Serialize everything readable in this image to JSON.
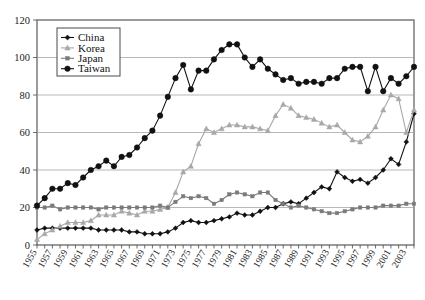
{
  "chart_data": {
    "type": "line",
    "title": "",
    "subtitle": "",
    "xlabel": "",
    "ylabel": "",
    "xlim": [
      1955,
      2004
    ],
    "ylim": [
      0,
      120
    ],
    "grid": true,
    "legend_position": "top-left-inside",
    "y_ticks": [
      0,
      20,
      40,
      60,
      80,
      100,
      120
    ],
    "y_tick_labels": [
      "0",
      "20",
      "40",
      "60",
      "80",
      "100",
      "120"
    ],
    "x_tick_labels": [
      "1955",
      "1957",
      "1959",
      "1961",
      "1963",
      "1965",
      "1967",
      "1969",
      "1971",
      "1973",
      "1975",
      "1977",
      "1979",
      "1981",
      "1983",
      "1985",
      "1987",
      "1989",
      "1991",
      "1993",
      "1995",
      "1997",
      "1999",
      "2001",
      "2003"
    ],
    "x": [
      1955,
      1956,
      1957,
      1958,
      1959,
      1960,
      1961,
      1962,
      1963,
      1964,
      1965,
      1966,
      1967,
      1968,
      1969,
      1970,
      1971,
      1972,
      1973,
      1974,
      1975,
      1976,
      1977,
      1978,
      1979,
      1980,
      1981,
      1982,
      1983,
      1984,
      1985,
      1986,
      1987,
      1988,
      1989,
      1990,
      1991,
      1992,
      1993,
      1994,
      1995,
      1996,
      1997,
      1998,
      1999,
      2000,
      2001,
      2002,
      2003,
      2004
    ],
    "series": [
      {
        "name": "China",
        "marker": "diamond",
        "color": "#111111",
        "values": [
          8,
          9,
          9,
          9,
          9,
          9,
          9,
          9,
          8,
          8,
          8,
          8,
          7,
          7,
          6,
          6,
          6,
          7,
          9,
          12,
          13,
          12,
          12,
          13,
          14,
          15,
          17,
          16,
          16,
          18,
          20,
          20,
          22,
          23,
          22,
          25,
          28,
          31,
          30,
          39,
          36,
          34,
          35,
          33,
          36,
          40,
          46,
          43,
          55,
          70
        ]
      },
      {
        "name": "Korea",
        "marker": "triangle",
        "color": "#a8a8a8",
        "values": [
          3,
          6,
          8,
          10,
          12,
          12,
          12,
          13,
          16,
          16,
          16,
          18,
          17,
          16,
          18,
          18,
          19,
          20,
          28,
          39,
          42,
          54,
          62,
          60,
          62,
          64,
          64,
          63,
          63,
          62,
          61,
          69,
          75,
          73,
          69,
          68,
          67,
          65,
          63,
          64,
          60,
          56,
          55,
          58,
          63,
          72,
          80,
          78,
          60,
          72
        ]
      },
      {
        "name": "Japan",
        "marker": "square",
        "color": "#7a7a7a",
        "values": [
          20,
          20,
          21,
          19,
          20,
          20,
          20,
          20,
          19,
          20,
          20,
          20,
          20,
          20,
          20,
          20,
          21,
          20,
          23,
          26,
          25,
          26,
          25,
          22,
          24,
          27,
          28,
          27,
          26,
          28,
          28,
          24,
          22,
          20,
          21,
          20,
          19,
          18,
          17,
          17,
          18,
          19,
          20,
          20,
          20,
          21,
          21,
          21,
          22,
          22
        ]
      },
      {
        "name": "Taiwan",
        "marker": "circle",
        "color": "#111111",
        "values": [
          21,
          25,
          30,
          30,
          33,
          32,
          36,
          40,
          42,
          45,
          42,
          47,
          48,
          52,
          57,
          61,
          69,
          79,
          89,
          96,
          83,
          93,
          93,
          99,
          104,
          107,
          107,
          100,
          95,
          99,
          94,
          91,
          88,
          89,
          86,
          87,
          87,
          86,
          89,
          89,
          94,
          95,
          95,
          82,
          95,
          82,
          89,
          86,
          90,
          95
        ]
      }
    ],
    "legend": [
      {
        "label": "China",
        "marker": "diamond",
        "color": "#111111"
      },
      {
        "label": "Korea",
        "marker": "triangle",
        "color": "#a8a8a8"
      },
      {
        "label": "Japan",
        "marker": "square",
        "color": "#7a7a7a"
      },
      {
        "label": "Taiwan",
        "marker": "circle",
        "color": "#111111"
      }
    ],
    "colors": {
      "background": "#ffffff",
      "frame": "#4a4a4a",
      "grid": "#9a9a9a",
      "text": "#1a1a1a"
    }
  }
}
